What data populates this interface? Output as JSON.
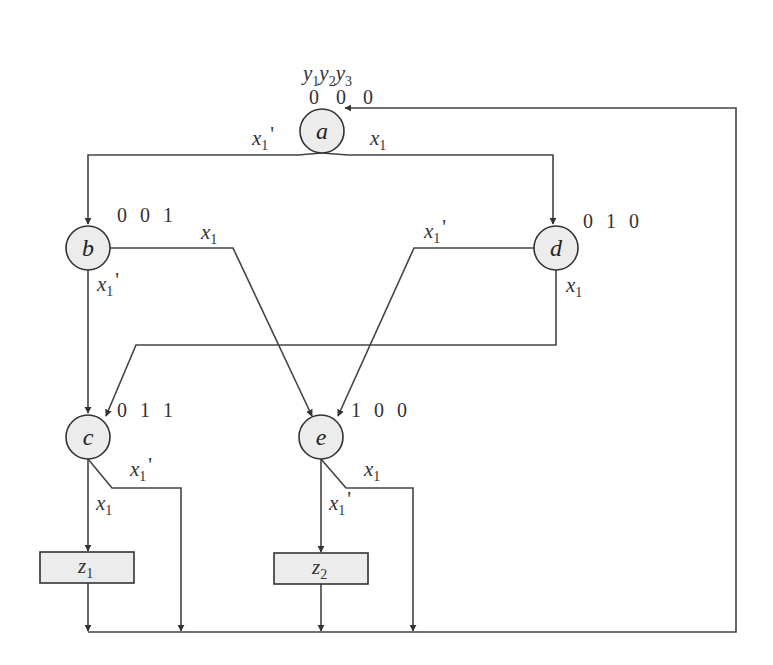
{
  "diagram": {
    "type": "ASM chart / state diagram",
    "header": {
      "variables": [
        "y1",
        "y2",
        "y3"
      ],
      "var_base": "y",
      "var_subs": [
        "1",
        "2",
        "3"
      ]
    },
    "states": [
      {
        "id": "a",
        "label": "a",
        "code": "0 0 0"
      },
      {
        "id": "b",
        "label": "b",
        "code": "0 0 1"
      },
      {
        "id": "c",
        "label": "c",
        "code": "0 1 1"
      },
      {
        "id": "d",
        "label": "d",
        "code": "0 1 0"
      },
      {
        "id": "e",
        "label": "e",
        "code": "1 0 0"
      }
    ],
    "outputs": [
      {
        "id": "z1",
        "base": "z",
        "sub": "1"
      },
      {
        "id": "z2",
        "base": "z",
        "sub": "2"
      }
    ],
    "transitions": [
      {
        "from": "a",
        "to": "b",
        "condition": "x1'"
      },
      {
        "from": "a",
        "to": "d",
        "condition": "x1"
      },
      {
        "from": "b",
        "to": "e",
        "condition": "x1"
      },
      {
        "from": "b",
        "to": "c",
        "condition": "x1'"
      },
      {
        "from": "d",
        "to": "e",
        "condition": "x1'"
      },
      {
        "from": "d",
        "to": "c",
        "condition": "x1"
      },
      {
        "from": "c",
        "to": "z1",
        "condition": "x1"
      },
      {
        "from": "c",
        "to": "a",
        "condition": "x1'"
      },
      {
        "from": "e",
        "to": "z2",
        "condition": "x1'"
      },
      {
        "from": "e",
        "to": "a",
        "condition": "x1"
      },
      {
        "from": "z1",
        "to": "a",
        "condition": ""
      },
      {
        "from": "z2",
        "to": "a",
        "condition": ""
      }
    ],
    "condition_base": "x",
    "condition_sub": "1",
    "prime_mark": "'"
  }
}
